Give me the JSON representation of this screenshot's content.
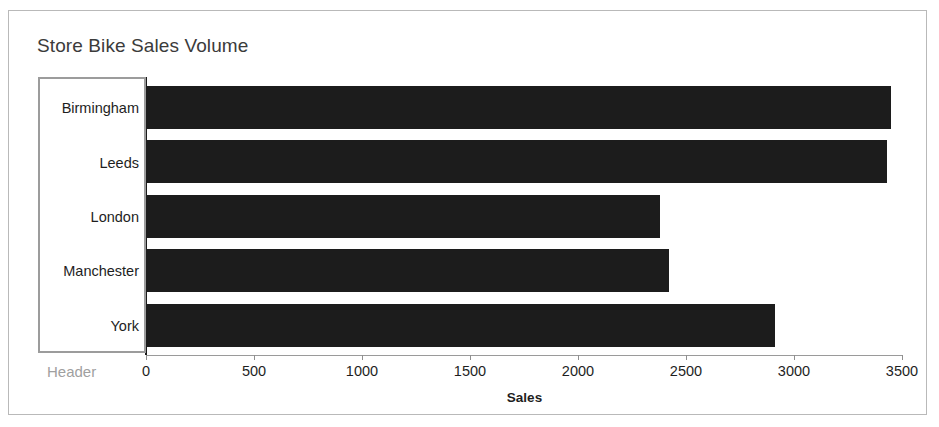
{
  "chart_data": {
    "type": "bar",
    "orientation": "horizontal",
    "title": "Store Bike Sales Volume",
    "categories": [
      "Birmingham",
      "Leeds",
      "London",
      "Manchester",
      "York"
    ],
    "values": [
      3450,
      3430,
      2380,
      2420,
      2910
    ],
    "series": [
      {
        "name": "Sales",
        "values": [
          3450,
          3430,
          2380,
          2420,
          2910
        ]
      }
    ],
    "xlabel": "Sales",
    "ylabel": "",
    "xlim": [
      0,
      3500
    ],
    "xticks": [
      0,
      500,
      1000,
      1500,
      2000,
      2500,
      3000,
      3500
    ],
    "xtick_labels": [
      "0",
      "500",
      "1000",
      "1500",
      "2000",
      "2500",
      "3000",
      "3500"
    ],
    "grid": false,
    "legend": false,
    "bar_color": "#1c1c1c"
  },
  "labels": {
    "category_header": "Header"
  },
  "colors": {
    "bar": "#1c1c1c",
    "selection_outline": "#9c9c9c",
    "frame_border": "#b9b9b9",
    "title_text": "#3b3b3b",
    "header_text": "#a0a0a0"
  }
}
